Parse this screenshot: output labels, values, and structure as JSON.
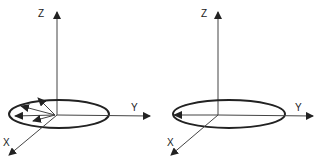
{
  "panels": [
    {
      "id": "left",
      "description": "Multiple vectors in the XY-plane distributed within an ellipse",
      "axes": {
        "z_label": "Z",
        "y_label": "Y",
        "x_label": "X"
      },
      "vector_count": 4
    },
    {
      "id": "right",
      "description": "Single vector in the XY-plane pointing along -Y to the ellipse edge",
      "axes": {
        "z_label": "Z",
        "y_label": "Y",
        "x_label": "X"
      },
      "vector_count": 1
    }
  ],
  "colors": {
    "stroke": "#222222",
    "background": "#ffffff"
  }
}
